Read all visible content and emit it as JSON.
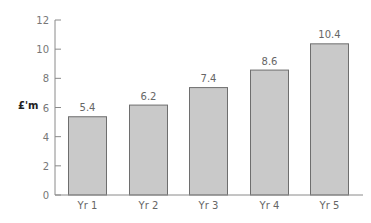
{
  "chart_data": {
    "type": "bar",
    "title": "",
    "xlabel": "",
    "ylabel": "£'m",
    "categories": [
      "Yr 1",
      "Yr 2",
      "Yr 3",
      "Yr 4",
      "Yr 5"
    ],
    "values": [
      5.4,
      6.2,
      7.4,
      8.6,
      10.4
    ],
    "value_labels": [
      "5.4",
      "6.2",
      "7.4",
      "8.6",
      "10.4"
    ],
    "ylim": [
      0,
      12
    ],
    "yticks": [
      0,
      2,
      4,
      6,
      8,
      10,
      12
    ],
    "grid": false,
    "legend": null,
    "colors": {
      "bar_fill": "#c9c9c9",
      "bar_stroke": "#6e6e6e",
      "axis": "#8a8a8a"
    }
  }
}
